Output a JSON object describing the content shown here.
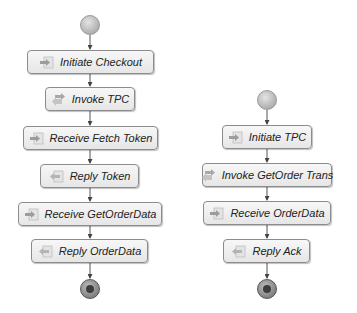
{
  "diagram": {
    "colors": {
      "node_border": "#8c8c8c",
      "node_fill": "#eeeeee",
      "edge": "#444444",
      "text": "#222222"
    },
    "left_flow": {
      "start": {
        "type": "start-event"
      },
      "nodes": [
        {
          "label": "Initiate Checkout",
          "icon": "receive-arrow-icon"
        },
        {
          "label": "Invoke TPC",
          "icon": "invoke-arrows-icon"
        },
        {
          "label": "Receive Fetch Token",
          "icon": "receive-arrow-icon"
        },
        {
          "label": "Reply Token",
          "icon": "reply-icon"
        },
        {
          "label": "Receive GetOrderData",
          "icon": "receive-arrow-icon"
        },
        {
          "label": "Reply OrderData",
          "icon": "reply-icon"
        }
      ],
      "end": {
        "type": "end-event"
      }
    },
    "right_flow": {
      "start": {
        "type": "start-event"
      },
      "nodes": [
        {
          "label": "Initiate TPC",
          "icon": "receive-arrow-icon"
        },
        {
          "label": "Invoke GetOrder Trans",
          "icon": "invoke-arrows-icon"
        },
        {
          "label": "Receive OrderData",
          "icon": "receive-arrow-icon"
        },
        {
          "label": "Reply Ack",
          "icon": "reply-icon"
        }
      ],
      "end": {
        "type": "end-event"
      }
    }
  }
}
